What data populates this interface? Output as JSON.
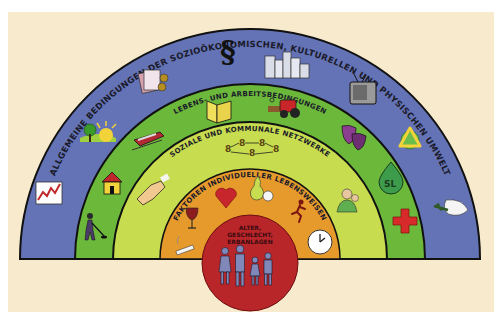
{
  "diagram": {
    "type": "determinants-of-health rainbow model",
    "colors": {
      "background": "#f8ebcd",
      "outline": "#111111",
      "layer_general": "#6473b5",
      "layer_living_working": "#6cb83b",
      "layer_social_community": "#c7dc4e",
      "layer_individual": "#e69a2c",
      "core": "#b8262a",
      "figures": "#7f88b8"
    },
    "layers": [
      {
        "id": "general",
        "label": "ALLGEMEINE BEDINGUNGEN DER SOZIOÖKONOMISCHEN, KULTURELLEN UND PHYSISCHEN UMWELT",
        "icons": [
          "rising-chart-icon",
          "sun-tree-landscape-icon",
          "money-banknotes-coins-icon",
          "paragraph-law-icon",
          "city-buildings-icon",
          "television-icon",
          "recycling-globe-icon",
          "peace-dove-icon"
        ]
      },
      {
        "id": "living_working",
        "label": "LEBENS- UND ARBEITSBEDINGUNGEN",
        "icons": [
          "worker-shovel-icon",
          "house-icon",
          "train-icon",
          "book-icon",
          "tractor-icon",
          "theater-masks-icon",
          "water-drop-emblem-icon",
          "red-cross-icon"
        ]
      },
      {
        "id": "social_community",
        "label": "SOZIALE UND KOMMUNALE NETZWERKE",
        "icons": [
          "handshake-icon",
          "people-network-icon",
          "elderly-care-icon"
        ]
      },
      {
        "id": "individual",
        "label": "FAKTOREN INDIVIDUELLER LEBENSWEISEN",
        "icons": [
          "cigarette-icon",
          "wine-glass-icon",
          "heart-icon",
          "pear-apple-icon",
          "runner-icon",
          "clock-icon"
        ]
      }
    ],
    "core": {
      "lines": [
        "ALTER,",
        "GESCHLECHT,",
        "ERBANLAGEN"
      ],
      "icon": "family-icon"
    }
  }
}
